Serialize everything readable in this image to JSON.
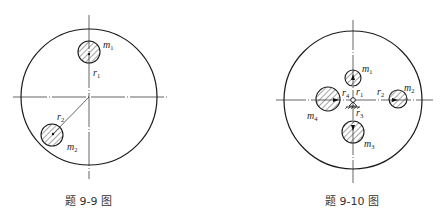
{
  "figures": [
    {
      "id": "fig-9-9",
      "caption": "题 9-9 图",
      "labels": {
        "m1": {
          "base": "m",
          "sub": "1"
        },
        "m2": {
          "base": "m",
          "sub": "2"
        },
        "r1": {
          "base": "r",
          "sub": "1"
        },
        "r2": {
          "base": "r",
          "sub": "2"
        }
      }
    },
    {
      "id": "fig-9-10",
      "caption": "题 9-10 图",
      "labels": {
        "m1": {
          "base": "m",
          "sub": "1"
        },
        "m2": {
          "base": "m",
          "sub": "2"
        },
        "m3": {
          "base": "m",
          "sub": "3"
        },
        "m4": {
          "base": "m",
          "sub": "4"
        },
        "r1": {
          "base": "r",
          "sub": "1"
        },
        "r2": {
          "base": "r",
          "sub": "2"
        },
        "r3": {
          "base": "r",
          "sub": "3"
        },
        "r4": {
          "base": "r",
          "sub": "4"
        }
      }
    }
  ],
  "colors": {
    "stroke": "#1a1a1a",
    "hatch": "#333333",
    "background": "#ffffff"
  }
}
